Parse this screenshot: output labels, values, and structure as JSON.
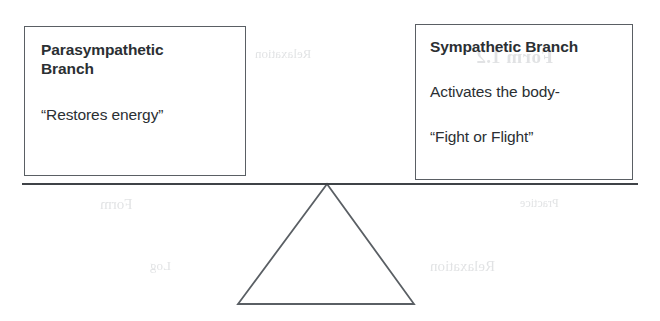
{
  "diagram": {
    "type": "balance-scale",
    "title_semantic": "autonomic-nervous-system-balance",
    "fulcrum": {
      "shape": "triangle",
      "apex": [
        327,
        184
      ],
      "base_left": [
        238,
        304
      ],
      "base_right": [
        414,
        304
      ]
    },
    "beam": {
      "x_start": 22,
      "x_end": 638,
      "y": 184,
      "tilt": "level"
    }
  },
  "left_box": {
    "title_line1": "Parasympathetic",
    "title_line2": "Branch",
    "body_line1": "“Restores energy”"
  },
  "right_box": {
    "title_line1": "Sympathetic Branch",
    "body_line1": "Activates the body-",
    "body_line2": "“Fight or Flight”"
  },
  "bleed_through": {
    "note": "faint mirrored show-through text from reverse side of scanned page",
    "fragments": [
      "Relaxation",
      "Form 1.2",
      "Form",
      "Relaxation",
      "Log",
      "Practice"
    ]
  },
  "colors": {
    "ink": "#2b2f33",
    "line": "#5a5f64",
    "beam": "#3f4347",
    "paper": "#ffffff",
    "bleed": "#9ea3a8"
  }
}
